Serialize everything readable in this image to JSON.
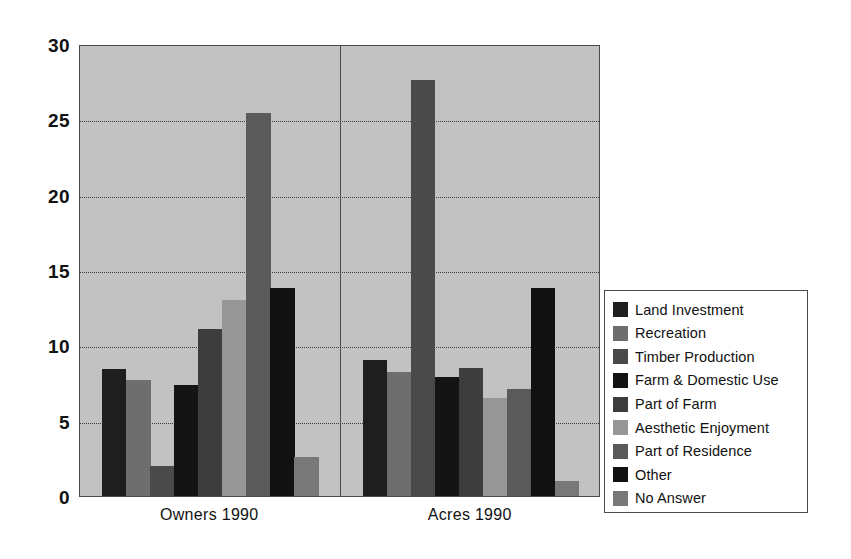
{
  "chart_data": {
    "type": "bar",
    "title": "",
    "subtitle": "",
    "xlabel": "",
    "ylabel": "",
    "categories": [
      "Owners 1990",
      "Acres 1990"
    ],
    "ylim": [
      0,
      30
    ],
    "yticks": [
      "0",
      "5",
      "10",
      "15",
      "20",
      "25",
      "30"
    ],
    "ytick_values": [
      0,
      5,
      10,
      15,
      20,
      25,
      30
    ],
    "grid": true,
    "grid_style": "dotted-horizontal",
    "legend_position": "right",
    "series": [
      {
        "name": "Land Investment",
        "color": "#1e1e1e",
        "values": [
          8.4,
          9.0
        ]
      },
      {
        "name": "Recreation",
        "color": "#6e6e6e",
        "values": [
          7.7,
          8.2
        ]
      },
      {
        "name": "Timber Production",
        "color": "#4a4a4a",
        "values": [
          2.0,
          27.6
        ]
      },
      {
        "name": "Farm & Domestic Use",
        "color": "#141414",
        "values": [
          7.4,
          7.9
        ]
      },
      {
        "name": "Part of Farm",
        "color": "#3d3d3d",
        "values": [
          11.1,
          8.5
        ]
      },
      {
        "name": "Aesthetic Enjoyment",
        "color": "#969696",
        "values": [
          13.0,
          6.5
        ]
      },
      {
        "name": "Part of Residence",
        "color": "#5a5a5a",
        "values": [
          25.4,
          7.1
        ]
      },
      {
        "name": "Other",
        "color": "#111111",
        "values": [
          13.8,
          13.8
        ]
      },
      {
        "name": "No Answer",
        "color": "#787878",
        "values": [
          2.6,
          1.0
        ]
      }
    ]
  },
  "legend": {
    "items": [
      {
        "label": "Land Investment"
      },
      {
        "label": "Recreation"
      },
      {
        "label": "Timber Production"
      },
      {
        "label": "Farm & Domestic Use"
      },
      {
        "label": "Part of Farm"
      },
      {
        "label": "Aesthetic Enjoyment"
      },
      {
        "label": "Part of Residence"
      },
      {
        "label": "Other"
      },
      {
        "label": "No Answer"
      }
    ]
  },
  "colors": {
    "plot_background": "#c2c2c2",
    "frame": "#4a4a4a",
    "grid": "#3a3a3a",
    "page_background": "#ffffff",
    "text": "#111111"
  },
  "caption": {
    "text": ""
  }
}
